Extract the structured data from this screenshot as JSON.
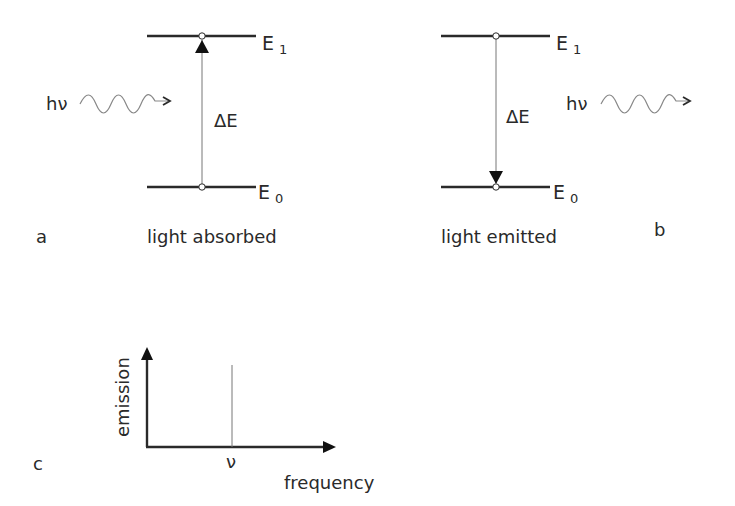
{
  "diagram": {
    "panel_a": {
      "label": "a",
      "caption": "light absorbed",
      "upper_level": {
        "name": "E",
        "index": "1"
      },
      "lower_level": {
        "name": "E",
        "index": "0"
      },
      "photon_label": "hν",
      "energy_gap_label": "ΔE",
      "transition": "upward"
    },
    "panel_b": {
      "label": "b",
      "caption": "light emitted",
      "upper_level": {
        "name": "E",
        "index": "1"
      },
      "lower_level": {
        "name": "E",
        "index": "0"
      },
      "photon_label": "hν",
      "energy_gap_label": "ΔE",
      "transition": "downward"
    },
    "panel_c": {
      "label": "c",
      "y_axis_label": "emission",
      "x_axis_label": "frequency",
      "line_label": "ν"
    }
  },
  "colors": {
    "line": "#2a2a2a",
    "thin_line": "#777777",
    "background": "#ffffff"
  }
}
